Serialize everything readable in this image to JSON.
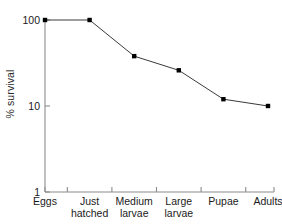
{
  "chart_data": {
    "type": "line",
    "title": "",
    "xlabel": "",
    "ylabel": "% survival",
    "categories": [
      "Eggs",
      "Just hatched",
      "Medium larvae",
      "Large larvae",
      "Pupae",
      "Adults"
    ],
    "values": [
      100,
      100,
      38,
      26,
      12,
      10
    ],
    "yscale": "log",
    "ylim": [
      1,
      100
    ],
    "ytick_labels": [
      "100",
      "10",
      "1"
    ],
    "ytick_values": [
      100,
      10,
      1
    ],
    "grid": false,
    "legend": null,
    "marker": "square",
    "marker_color": "#000000",
    "line_color": "#3a3a3a",
    "axis_color": "#8c8c8c",
    "background": "#ffffff"
  },
  "axis": {
    "y_label": "% survival",
    "y_ticks": [
      {
        "label": "100",
        "value": 100
      },
      {
        "label": "10",
        "value": 10
      },
      {
        "label": "1",
        "value": 1
      }
    ],
    "x_ticks": [
      {
        "label": "Eggs"
      },
      {
        "label": "Just\nhatched"
      },
      {
        "label": "Medium\nlarvae"
      },
      {
        "label": "Large\nlarvae"
      },
      {
        "label": "Pupae"
      },
      {
        "label": "Adults"
      }
    ]
  }
}
